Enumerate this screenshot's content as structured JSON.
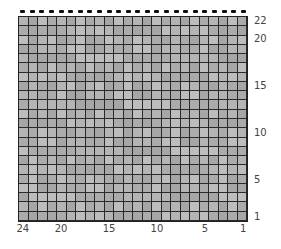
{
  "chart": {
    "type": "knitting-chart-grid",
    "columns": 24,
    "rows": 22,
    "cell_color": "#b0b0b0",
    "grid_line_color": "#2a2a2a",
    "top_marker": "bind-off dash",
    "row_labels": [
      {
        "label": "22",
        "row": 22
      },
      {
        "label": "20",
        "row": 20
      },
      {
        "label": "15",
        "row": 15
      },
      {
        "label": "10",
        "row": 10
      },
      {
        "label": "5",
        "row": 5
      },
      {
        "label": "1",
        "row": 1
      }
    ],
    "column_labels": [
      {
        "label": "24",
        "col": 24
      },
      {
        "label": "20",
        "col": 20
      },
      {
        "label": "15",
        "col": 15
      },
      {
        "label": "10",
        "col": 10
      },
      {
        "label": "5",
        "col": 5
      },
      {
        "label": "1",
        "col": 1
      }
    ]
  }
}
